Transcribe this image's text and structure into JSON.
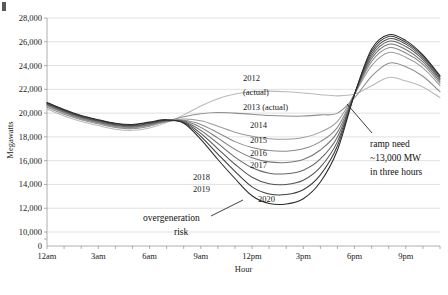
{
  "chart_data": {
    "type": "line",
    "title": "",
    "xlabel": "Hour",
    "ylabel": "Megawatts",
    "ylim": [
      0,
      28000
    ],
    "y_ticks": [
      "0",
      "10,000",
      "12,000",
      "14,000",
      "16,000",
      "18,000",
      "20,000",
      "22,000",
      "24,000",
      "26,000",
      "28,000"
    ],
    "y_axis_broken": true,
    "x_ticks": [
      "12am",
      "3am",
      "6am",
      "9am",
      "12pm",
      "3pm",
      "6pm",
      "9pm"
    ],
    "x": [
      0,
      1,
      2,
      3,
      4,
      5,
      6,
      7,
      8,
      9,
      10,
      11,
      12,
      13,
      14,
      15,
      16,
      17,
      18,
      19,
      20,
      21,
      22,
      23
    ],
    "grid": "horizontal",
    "legend": "inline-labels",
    "series": [
      {
        "name": "2012 (actual)",
        "label": "2012",
        "label2": "(actual)",
        "color": "#b9b9b9",
        "values": [
          20350,
          19750,
          19300,
          18950,
          18650,
          18550,
          18750,
          19200,
          19850,
          20600,
          21200,
          21600,
          21800,
          21850,
          21800,
          21700,
          21550,
          21450,
          21600,
          22300,
          23000,
          22700,
          22200,
          21300
        ]
      },
      {
        "name": "2013 (actual)",
        "label": "2013 (actual)",
        "color": "#8e8e8e",
        "values": [
          20500,
          19900,
          19450,
          19100,
          18800,
          18700,
          18900,
          19300,
          19700,
          19950,
          20050,
          20000,
          19900,
          19800,
          19750,
          19750,
          19850,
          20000,
          21300,
          23100,
          24200,
          23900,
          23100,
          21800
        ]
      },
      {
        "name": "2014",
        "label": "2014",
        "color": "#9c9c9c",
        "values": [
          20600,
          20000,
          19500,
          19150,
          18850,
          18750,
          18950,
          19300,
          19500,
          19350,
          18900,
          18400,
          18050,
          17850,
          17800,
          17950,
          18400,
          19300,
          21600,
          24000,
          25100,
          24700,
          23800,
          22300
        ]
      },
      {
        "name": "2015",
        "label": "2015",
        "color": "#8a8a8a",
        "values": [
          20650,
          20050,
          19550,
          19200,
          18900,
          18800,
          19000,
          19300,
          19400,
          19050,
          18350,
          17600,
          17100,
          16850,
          16800,
          17000,
          17600,
          18800,
          21600,
          24350,
          25500,
          25050,
          24100,
          22500
        ]
      },
      {
        "name": "2016",
        "label": "2016",
        "color": "#787878",
        "values": [
          20700,
          20100,
          19600,
          19250,
          18950,
          18850,
          19050,
          19350,
          19350,
          18800,
          17900,
          16950,
          16250,
          15900,
          15850,
          16100,
          16900,
          18400,
          21600,
          24600,
          25800,
          25350,
          24300,
          22650
        ]
      },
      {
        "name": "2017",
        "label": "2017",
        "color": "#666666",
        "values": [
          20750,
          20150,
          19650,
          19300,
          19000,
          18900,
          19100,
          19350,
          19300,
          18550,
          17450,
          16300,
          15400,
          14950,
          14900,
          15200,
          16150,
          18000,
          21600,
          24800,
          26050,
          25600,
          24500,
          22800
        ]
      },
      {
        "name": "2018",
        "label": "2018",
        "color": "#545454",
        "values": [
          20800,
          20200,
          19700,
          19350,
          19050,
          18950,
          19150,
          19400,
          19250,
          18300,
          17000,
          15700,
          14600,
          14050,
          14000,
          14350,
          15450,
          17600,
          21600,
          25000,
          26250,
          25800,
          24650,
          22900
        ]
      },
      {
        "name": "2019",
        "label": "2019",
        "color": "#3d3d3d",
        "values": [
          20850,
          20250,
          19750,
          19400,
          19100,
          19000,
          19200,
          19400,
          19200,
          18050,
          16550,
          15100,
          13800,
          13200,
          13150,
          13550,
          14800,
          17250,
          21600,
          25200,
          26450,
          25950,
          24800,
          23050
        ]
      },
      {
        "name": "2020",
        "label": "2020",
        "color": "#2b2b2b",
        "values": [
          20900,
          20300,
          19800,
          19450,
          19150,
          19050,
          19250,
          19450,
          19150,
          17800,
          16100,
          14500,
          13050,
          12400,
          12350,
          12800,
          14200,
          16900,
          21600,
          25400,
          26600,
          26100,
          24900,
          23150
        ]
      }
    ],
    "annotations": [
      {
        "name": "ramp-need",
        "lines": [
          "ramp need",
          "~13,000 MW",
          "in three hours"
        ]
      },
      {
        "name": "overgeneration-risk",
        "lines": [
          "overgeneration",
          "risk"
        ]
      }
    ]
  }
}
